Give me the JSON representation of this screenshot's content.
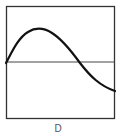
{
  "diagram": {
    "label": "D",
    "frame_color": "#333333",
    "curve_color": "#111111",
    "axis_color": "#444444"
  }
}
